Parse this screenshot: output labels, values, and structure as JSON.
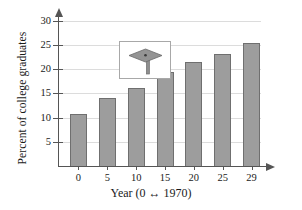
{
  "chart_data": {
    "type": "bar",
    "title": "",
    "subtitle": "",
    "xlabel": "Year (0 ↔ 1970)",
    "ylabel": "Percent of college graduates",
    "categories": [
      "0",
      "5",
      "10",
      "15",
      "20",
      "25",
      "29"
    ],
    "values": [
      10.7,
      14.0,
      16.2,
      19.4,
      21.4,
      23.2,
      25.4
    ],
    "series": [
      {
        "name": "Percent of college graduates",
        "values": [
          10.7,
          14.0,
          16.2,
          19.4,
          21.4,
          23.2,
          25.4
        ]
      }
    ],
    "ylim": [
      0,
      31
    ],
    "yticks": [
      5,
      10,
      15,
      20,
      25,
      30
    ],
    "ytick_labels": [
      "5",
      "10",
      "15",
      "20",
      "25",
      "30"
    ],
    "xtick_labels": [
      "0",
      "5",
      "10",
      "15",
      "20",
      "25",
      "29"
    ],
    "grid": "horizontal",
    "legend": "none",
    "annotations": [
      "graduation-cap inset image"
    ],
    "colors": {
      "bar_fill": "#9d9d9d",
      "bar_edge": "#6f6f6f",
      "gridline": "#dcdcdc",
      "axis": "#555555",
      "text": "#1a1a1a",
      "background": "#ffffff",
      "cap_box_border": "#a8a8a8",
      "cap_fill": "#8e8e8e"
    }
  },
  "inset": {
    "icon_name": "graduation-cap-icon",
    "caption": ""
  }
}
